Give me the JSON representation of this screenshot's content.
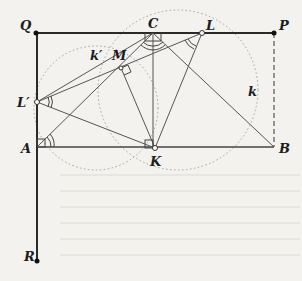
{
  "figure": {
    "labels": {
      "Q": "Q",
      "C": "C",
      "L": "L",
      "P": "P",
      "k_prime": "k′",
      "M": "M",
      "k": "k",
      "L_prime": "L′",
      "A": "A",
      "K": "K",
      "B": "B",
      "R": "R"
    },
    "points": {
      "Q": [
        36,
        33
      ],
      "P": [
        274,
        33
      ],
      "R": [
        37,
        261
      ],
      "A": [
        37,
        147
      ],
      "B": [
        274,
        147
      ],
      "K": [
        155,
        148
      ],
      "L_prime": [
        37,
        102
      ],
      "C": [
        153,
        33
      ],
      "L": [
        202,
        33
      ],
      "M": [
        121,
        68
      ]
    },
    "colors": {
      "line": "#2a2a2a",
      "thin_line": "#555555",
      "dotted": "#9a9a9a",
      "background": "#f3f2ef"
    }
  }
}
